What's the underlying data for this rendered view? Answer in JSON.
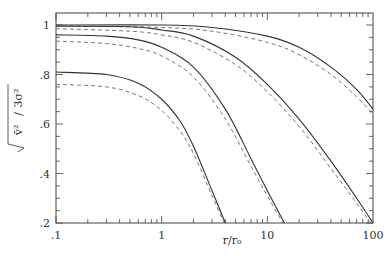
{
  "chart_data": {
    "type": "line",
    "title": "",
    "xlabel": "r/r₀",
    "ylabel": "√(v̄²/3σ²)",
    "xscale": "log",
    "xlim": [
      0.1,
      100
    ],
    "ylim": [
      0.2,
      1.05
    ],
    "x_ticks": [
      0.1,
      1,
      10,
      100
    ],
    "x_tick_labels": [
      ".1",
      "1",
      "10",
      "100"
    ],
    "y_ticks": [
      0.2,
      0.4,
      0.6,
      0.8,
      1.0
    ],
    "y_tick_labels": [
      ".2",
      ".4",
      ".6",
      ".8",
      "1"
    ],
    "grid": false,
    "legend": null,
    "series": [
      {
        "name": "solid-1",
        "style": "solid",
        "x": [
          0.1,
          1,
          3,
          10,
          20,
          40,
          70,
          100
        ],
        "y": [
          1.0,
          1.0,
          0.99,
          0.955,
          0.91,
          0.83,
          0.74,
          0.66
        ]
      },
      {
        "name": "dashed-1",
        "style": "dashed",
        "x": [
          0.1,
          1,
          3,
          10,
          20,
          40,
          70,
          100
        ],
        "y": [
          0.997,
          0.99,
          0.975,
          0.93,
          0.88,
          0.8,
          0.71,
          0.64
        ]
      },
      {
        "name": "solid-2",
        "style": "solid",
        "x": [
          0.1,
          0.5,
          1,
          2,
          5,
          10,
          20,
          40,
          70,
          100
        ],
        "y": [
          0.995,
          0.993,
          0.98,
          0.955,
          0.87,
          0.76,
          0.62,
          0.45,
          0.3,
          0.2
        ]
      },
      {
        "name": "dashed-2",
        "style": "dashed",
        "x": [
          0.1,
          0.5,
          1,
          2,
          5,
          10,
          20,
          40,
          70,
          95
        ],
        "y": [
          0.985,
          0.975,
          0.96,
          0.93,
          0.84,
          0.73,
          0.59,
          0.42,
          0.28,
          0.2
        ]
      },
      {
        "name": "solid-3",
        "style": "solid",
        "x": [
          0.1,
          0.3,
          0.6,
          1,
          2,
          4,
          7,
          10,
          14.5
        ],
        "y": [
          0.96,
          0.955,
          0.94,
          0.91,
          0.83,
          0.66,
          0.46,
          0.33,
          0.2
        ]
      },
      {
        "name": "dashed-3",
        "style": "dashed",
        "x": [
          0.1,
          0.3,
          0.6,
          1,
          2,
          4,
          7,
          10,
          14
        ],
        "y": [
          0.935,
          0.925,
          0.905,
          0.875,
          0.79,
          0.62,
          0.43,
          0.31,
          0.2
        ]
      },
      {
        "name": "solid-4",
        "style": "solid",
        "x": [
          0.1,
          0.3,
          0.6,
          1,
          1.5,
          2,
          3,
          4.0
        ],
        "y": [
          0.81,
          0.8,
          0.765,
          0.7,
          0.61,
          0.51,
          0.33,
          0.2
        ]
      },
      {
        "name": "dashed-4",
        "style": "dashed",
        "x": [
          0.1,
          0.3,
          0.6,
          1,
          1.5,
          2,
          3,
          3.9
        ],
        "y": [
          0.76,
          0.75,
          0.715,
          0.655,
          0.57,
          0.48,
          0.31,
          0.2
        ]
      }
    ]
  },
  "labels": {
    "xlabel": "r/r₀",
    "ylabel_num": "v̄²",
    "ylabel_den": "3σ²"
  }
}
